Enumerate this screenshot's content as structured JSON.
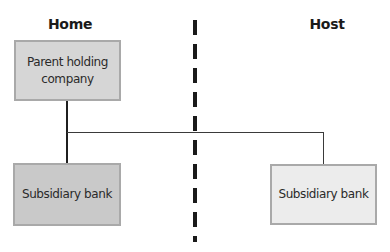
{
  "diagram": {
    "type": "organizational-structure",
    "regions": [
      {
        "id": "home",
        "label": "Home"
      },
      {
        "id": "host",
        "label": "Host"
      }
    ],
    "nodes": [
      {
        "id": "parent",
        "label_line1": "Parent holding",
        "label_line2": "company",
        "region": "home",
        "fill": "#d6d6d6"
      },
      {
        "id": "sub_home",
        "label": "Subsidiary bank",
        "region": "home",
        "fill": "#c9c9c9"
      },
      {
        "id": "sub_host",
        "label": "Subsidiary bank",
        "region": "host",
        "fill": "#ececec"
      }
    ],
    "edges": [
      {
        "from": "parent",
        "to": "sub_home"
      },
      {
        "from": "parent",
        "to": "sub_host"
      }
    ],
    "divider": {
      "style": "dashed",
      "color": "#1a1a1a",
      "separates": [
        "home",
        "host"
      ]
    }
  }
}
